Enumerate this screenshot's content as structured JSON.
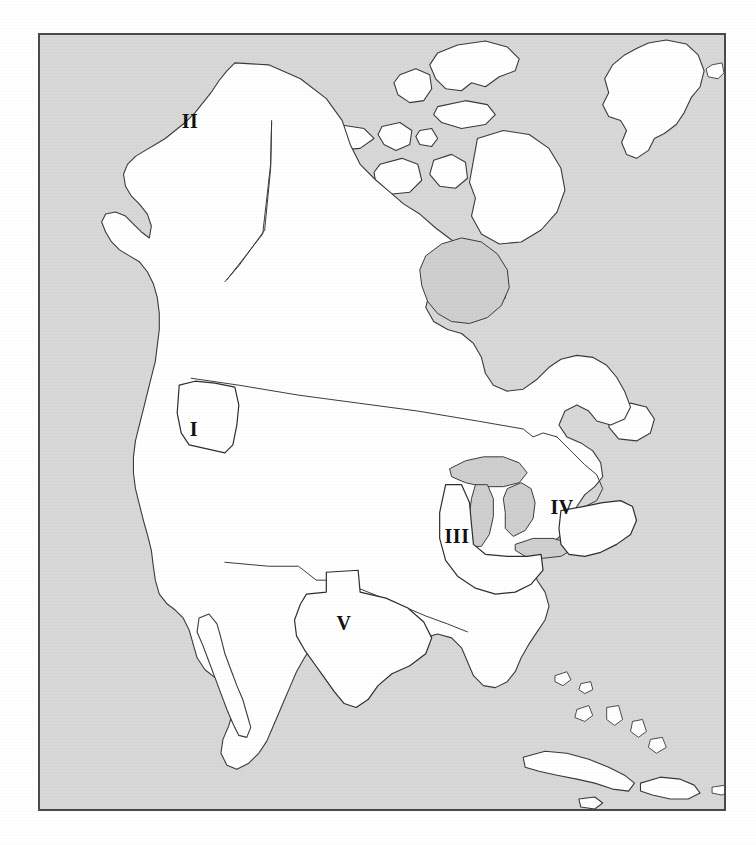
{
  "figure": {
    "kind": "reference-map",
    "frame": {
      "border_color": "#4a4a4a",
      "x": 38,
      "y": 33,
      "width": 688,
      "height": 778
    }
  },
  "colors": {
    "page_background": "#ffffff",
    "ocean": "#d8d8d8",
    "land": "#ffffff",
    "lake": "#cfcfcf",
    "coastline": "#3a3a3a",
    "label_text": "#111111",
    "frame": "#4a4a4a"
  },
  "map": {
    "projection_note": "conic, North America centred",
    "labels": [
      {
        "id": "region-1",
        "text": "I",
        "x": 192,
        "y": 427
      },
      {
        "id": "region-2",
        "text": "II",
        "x": 188,
        "y": 119
      },
      {
        "id": "region-3",
        "text": "III",
        "x": 455,
        "y": 534
      },
      {
        "id": "region-4",
        "text": "IV",
        "x": 560,
        "y": 505
      },
      {
        "id": "region-5",
        "text": "V",
        "x": 342,
        "y": 621
      }
    ],
    "water_bodies": [
      {
        "name": "Pacific Ocean"
      },
      {
        "name": "Atlantic Ocean"
      },
      {
        "name": "Arctic Ocean"
      },
      {
        "name": "Hudson Bay"
      },
      {
        "name": "Gulf of Mexico"
      },
      {
        "name": "Caribbean Sea"
      },
      {
        "name": "Gulf of California"
      },
      {
        "name": "Great Lakes"
      }
    ],
    "landmasses": [
      {
        "name": "North American mainland"
      },
      {
        "name": "Greenland"
      },
      {
        "name": "Iceland"
      },
      {
        "name": "Canadian Arctic Archipelago"
      },
      {
        "name": "Baffin Island"
      },
      {
        "name": "Victoria Island"
      },
      {
        "name": "Banks Island"
      },
      {
        "name": "Ellesmere Island"
      },
      {
        "name": "Newfoundland"
      },
      {
        "name": "Vancouver Island"
      },
      {
        "name": "Baja California"
      },
      {
        "name": "Cuba"
      },
      {
        "name": "Hispaniola"
      },
      {
        "name": "Jamaica"
      },
      {
        "name": "Puerto Rico"
      },
      {
        "name": "Bahamas"
      }
    ],
    "outlined_regions": [
      {
        "label": "I",
        "kind": "state-outline"
      },
      {
        "label": "II",
        "kind": "state-outline"
      },
      {
        "label": "III",
        "kind": "state-outline"
      },
      {
        "label": "IV",
        "kind": "state-outline"
      },
      {
        "label": "V",
        "kind": "state-outline"
      }
    ],
    "internal_boundaries": [
      {
        "name": "United States - Canada border"
      },
      {
        "name": "United States - Mexico border"
      },
      {
        "name": "Alaska - Canada border"
      }
    ]
  }
}
